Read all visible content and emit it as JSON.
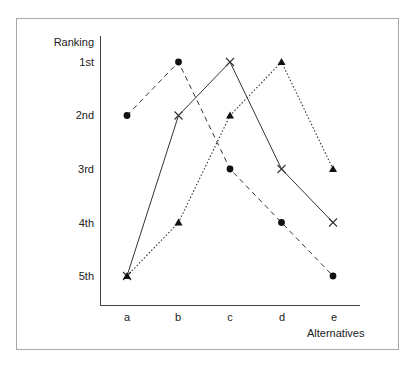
{
  "chart_data": {
    "type": "line",
    "title": "",
    "xlabel": "Alternatives",
    "ylabel": "Ranking",
    "categories": [
      "a",
      "b",
      "c",
      "d",
      "e"
    ],
    "y_ticks": [
      "1st",
      "2nd",
      "3rd",
      "4th",
      "5th"
    ],
    "y_axis_inverted": true,
    "ylim": [
      5,
      1
    ],
    "grid": false,
    "legend": null,
    "series": [
      {
        "name": "circle-dashed",
        "marker": "circle",
        "line_style": "dashed",
        "values": [
          2,
          1,
          3,
          4,
          5
        ]
      },
      {
        "name": "x-solid",
        "marker": "x",
        "line_style": "solid",
        "values": [
          5,
          2,
          1,
          3,
          4
        ]
      },
      {
        "name": "triangle-dotted",
        "marker": "triangle",
        "line_style": "dotted",
        "values": [
          5,
          4,
          2,
          1,
          3
        ]
      }
    ]
  },
  "axes": {
    "y_title": "Ranking",
    "x_title": "Alternatives",
    "y_ticks": [
      "1st",
      "2nd",
      "3rd",
      "4th",
      "5th"
    ],
    "x_ticks": [
      "a",
      "b",
      "c",
      "d",
      "e"
    ]
  },
  "colors": {
    "line": "#333333",
    "frame": "#a8a8a8",
    "marker": "#111111"
  }
}
